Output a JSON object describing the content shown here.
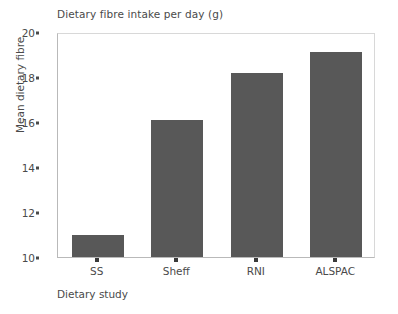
{
  "chart_data": {
    "type": "bar",
    "title": "Dietary fibre intake per day (g)",
    "xlabel": "Dietary study",
    "ylabel": "Mean dietary fibre",
    "categories": [
      "SS",
      "Sheff",
      "RNI",
      "ALSPAC"
    ],
    "values": [
      11.0,
      16.1,
      18.2,
      19.1
    ],
    "ylim": [
      10,
      20
    ],
    "yticks": [
      10,
      12,
      14,
      16,
      18,
      20
    ],
    "ytick_labels": [
      "10",
      "12",
      "14",
      "16",
      "18",
      "20"
    ],
    "grid": false,
    "legend": null,
    "bar_color": "#585858",
    "axis_color": "#b9b9b9",
    "text_color": "#4a4a4a",
    "background": "#ffffff"
  }
}
